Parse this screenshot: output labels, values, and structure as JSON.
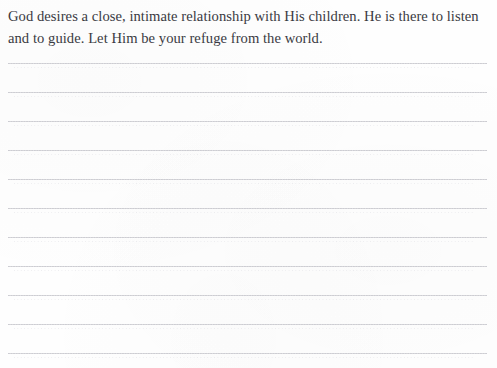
{
  "page": {
    "type": "journal-page",
    "width": 497,
    "height": 368,
    "background_color": "#fefefe"
  },
  "devotional": {
    "text": "God desires a close, intimate relationship with His children. He is there to listen and to guide. Let Him be your refuge from the world.",
    "text_color": "#3a3a42",
    "lines": [
      "God desires a close, intimate relationship with His children. He is there",
      "to listen and to guide. Let Him be your refuge from the world."
    ]
  },
  "writing_area": {
    "line_color": "#cfcfd4",
    "line_count": 11,
    "line_style": "dotted",
    "left": 8,
    "right": 487,
    "spacing": 29,
    "lines": [
      {
        "index": 1,
        "y": 63,
        "value": ""
      },
      {
        "index": 2,
        "y": 92,
        "value": ""
      },
      {
        "index": 3,
        "y": 121,
        "value": ""
      },
      {
        "index": 4,
        "y": 150,
        "value": ""
      },
      {
        "index": 5,
        "y": 179,
        "value": ""
      },
      {
        "index": 6,
        "y": 208,
        "value": ""
      },
      {
        "index": 7,
        "y": 237,
        "value": ""
      },
      {
        "index": 8,
        "y": 266,
        "value": ""
      },
      {
        "index": 9,
        "y": 295,
        "value": ""
      },
      {
        "index": 10,
        "y": 324,
        "value": ""
      },
      {
        "index": 11,
        "y": 353,
        "value": ""
      }
    ]
  }
}
